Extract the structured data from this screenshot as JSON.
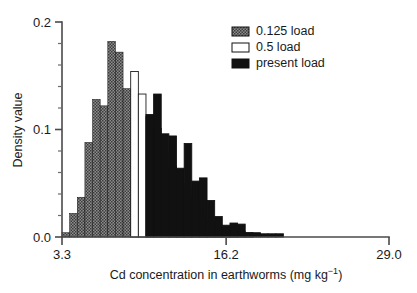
{
  "chart_data": {
    "type": "bar",
    "title": "",
    "subtitle": "",
    "xlabel": "Cd concentration in earthworms (mg kg⁻¹)",
    "ylabel": "Density value",
    "xlim": [
      3.3,
      29.0
    ],
    "ylim": [
      0.0,
      0.2
    ],
    "grid": false,
    "legend_position": "top-right",
    "x_tick_labels": [
      "3.3",
      "16.2",
      "29.0"
    ],
    "x_tick_values": [
      3.3,
      16.2,
      29.0
    ],
    "y_tick_labels": [
      "0.0",
      "0.1",
      "0.2"
    ],
    "y_tick_values": [
      0.0,
      0.1,
      0.2
    ],
    "y_minor_tick_values": [
      0.02,
      0.04,
      0.06,
      0.08,
      0.12,
      0.14,
      0.16,
      0.18
    ],
    "bin_width": 0.6,
    "bin_starts": [
      3.3,
      3.9,
      4.5,
      5.1,
      5.7,
      6.3,
      6.9,
      7.5,
      8.1,
      8.7,
      9.3,
      9.9,
      10.5,
      11.1,
      11.7,
      12.3,
      12.9,
      13.5,
      14.1,
      14.7,
      15.3,
      15.9,
      16.5,
      17.1,
      17.7,
      18.3,
      18.9,
      19.5,
      20.1,
      20.7,
      21.3,
      21.9,
      22.5,
      23.1,
      23.7,
      24.3,
      24.9,
      25.5,
      26.1,
      26.7,
      27.3,
      27.9,
      28.5
    ],
    "series": [
      {
        "name": "0.125 load",
        "fill_style": "checkered",
        "color": "#6e6e6e",
        "values": [
          0.004,
          0.022,
          0.037,
          0.088,
          0.128,
          0.122,
          0.182,
          0.172,
          0.138,
          0.11,
          0.094,
          0.074,
          0.059,
          0.059,
          0.044,
          0.02,
          0.02,
          0.02,
          0.008,
          0.007,
          0.005,
          0.004,
          0.003,
          0.0,
          0.0,
          0.0,
          0.0,
          0.0,
          0.0,
          0.0,
          0.0,
          0.0,
          0.0,
          0.0,
          0.0,
          0.0,
          0.0,
          0.0,
          0.0,
          0.0,
          0.0,
          0.0,
          0.0
        ]
      },
      {
        "name": "0.5 load",
        "fill_style": "open",
        "color": "#ffffff",
        "values": [
          0.0,
          0.0,
          0.0,
          0.0,
          0.0,
          0.0,
          0.0,
          0.0,
          0.0,
          0.154,
          0.133,
          0.112,
          0.101,
          0.078,
          0.066,
          0.05,
          0.044,
          0.038,
          0.016,
          0.013,
          0.009,
          0.008,
          0.006,
          0.005,
          0.004,
          0.0,
          0.0,
          0.0,
          0.0,
          0.0,
          0.0,
          0.0,
          0.0,
          0.0,
          0.0,
          0.0,
          0.0,
          0.0,
          0.0,
          0.0,
          0.0,
          0.0,
          0.0
        ]
      },
      {
        "name": "present load",
        "fill_style": "solid",
        "color": "#111111",
        "values": [
          0.0,
          0.0,
          0.0,
          0.0,
          0.0,
          0.0,
          0.0,
          0.0,
          0.0,
          0.0,
          0.0,
          0.114,
          0.133,
          0.096,
          0.094,
          0.064,
          0.087,
          0.052,
          0.055,
          0.034,
          0.019,
          0.011,
          0.013,
          0.012,
          0.004,
          0.004,
          0.003,
          0.003,
          0.003,
          0.0,
          0.0,
          0.0,
          0.0,
          0.0,
          0.0,
          0.0,
          0.0,
          0.0,
          0.0,
          0.0,
          0.0,
          0.0,
          0.0
        ]
      }
    ],
    "legend": [
      {
        "label": "0.125 load",
        "swatch": "checkered"
      },
      {
        "label": "0.5 load",
        "swatch": "open"
      },
      {
        "label": "present load",
        "swatch": "solid"
      }
    ]
  },
  "axes": {
    "x_label": "Cd concentration in earthworms (mg kg⁻¹)",
    "y_label": "Density value",
    "x_ticks": [
      "3.3",
      "16.2",
      "29.0"
    ],
    "y_ticks": [
      "0.0",
      "0.1",
      "0.2"
    ]
  },
  "legend": {
    "item_0": "0.125 load",
    "item_1": "0.5 load",
    "item_2": "present load"
  }
}
